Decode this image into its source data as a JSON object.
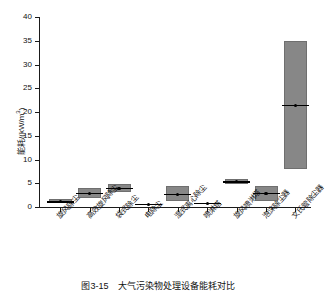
{
  "chart_data": {
    "type": "bar",
    "title": "",
    "xlabel": "",
    "ylabel": "能耗/(kW/m",
    "ylabel_sup": "3",
    "ylabel_tail": ")",
    "ylim": [
      0,
      40
    ],
    "yticks": [
      0,
      5,
      10,
      15,
      20,
      25,
      30,
      35,
      40
    ],
    "ytick_labels": [
      "0",
      "5",
      "10",
      "15",
      "20",
      "25",
      "30",
      "35",
      "40"
    ],
    "grid": false,
    "legend": "none",
    "categories": [
      "旋风除尘",
      "高效旋风除尘",
      "袋式除尘",
      "电除尘",
      "湿式离心除尘",
      "喷淋塔",
      "旋风喷淋塔",
      "泡沫除尘器",
      "文氏管除尘器"
    ],
    "series": [
      {
        "name": "能耗区间下限",
        "values": [
          0.8,
          1.8,
          3.2,
          0.4,
          1.2,
          0.7,
          4.8,
          1.2,
          8.0
        ]
      },
      {
        "name": "能耗区间上限",
        "values": [
          1.6,
          4.0,
          4.8,
          1.0,
          4.4,
          0.9,
          6.0,
          4.5,
          35.0
        ]
      },
      {
        "name": "能耗中位值",
        "values": [
          1.2,
          2.9,
          4.0,
          0.7,
          2.7,
          0.8,
          5.4,
          2.9,
          21.5
        ]
      }
    ],
    "box_fill_color": "#878787",
    "median_color": "#000000",
    "axis_color": "#1a1a1a"
  },
  "caption": {
    "text": "图3-15　大气污染物处理设备能耗对比"
  }
}
